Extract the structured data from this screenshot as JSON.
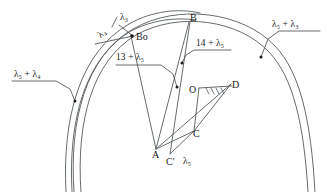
{
  "figure": {
    "type": "line-diagram",
    "background": "#ffffff",
    "stroke_color": "#4a4a4a",
    "text_color": "#1a1a1a",
    "width": 327,
    "height": 192
  },
  "points": [
    {
      "id": "B",
      "label": "B",
      "x": 192,
      "y": 19
    },
    {
      "id": "B0",
      "label": "Bo",
      "x": 133,
      "y": 38
    },
    {
      "id": "O",
      "label": "O",
      "x": 186,
      "y": 91
    },
    {
      "id": "D",
      "label": "D",
      "x": 232,
      "y": 87
    },
    {
      "id": "C",
      "label": "C",
      "x": 192,
      "y": 136
    },
    {
      "id": "A",
      "label": "A",
      "x": 156,
      "y": 153
    },
    {
      "id": "Cp",
      "label": "C'",
      "x": 172,
      "y": 159
    }
  ],
  "annotations": [
    {
      "id": "lam5_lam4",
      "text": "λ₅ + λ₄",
      "x": 14,
      "y": 71,
      "role": "leader-label-left"
    },
    {
      "id": "lam5_lam3",
      "text": "λ₅ + λ₃",
      "x": 272,
      "y": 20,
      "role": "leader-label-right"
    },
    {
      "id": "lam4",
      "text": "λ₄",
      "x": 99,
      "y": 34,
      "role": "arc-label"
    },
    {
      "id": "lam3",
      "text": "λ₃",
      "x": 122,
      "y": 15,
      "role": "arc-label"
    },
    {
      "id": "n13_lam5",
      "text": "13 + λ₅",
      "x": 117,
      "y": 54,
      "role": "leader-label"
    },
    {
      "id": "n14_lam5",
      "text": "14 + λ₅",
      "x": 196,
      "y": 40,
      "role": "leader-label"
    },
    {
      "id": "lam5",
      "text": "λ₅",
      "x": 185,
      "y": 158,
      "role": "link-label"
    }
  ],
  "elements": {
    "arcs_outer_count": 2,
    "arcs_inner_count": 2,
    "ground_hatch": "hatched-support-at-D",
    "leader_dots": 4
  }
}
